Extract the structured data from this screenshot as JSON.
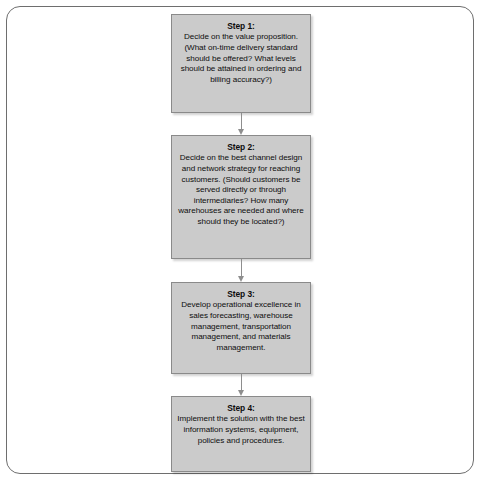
{
  "figure": {
    "type": "flowchart",
    "orientation": "vertical",
    "frame": {
      "border_color": "#6e6e6e",
      "background": "#ffffff",
      "corner_radius": "rounded"
    },
    "box_style": {
      "fill": "#cbcbcb",
      "border_color": "#8a8a8a",
      "text_color": "#0d0d0d",
      "shadow": true
    },
    "connector_style": {
      "kind": "down-arrow",
      "color": "#8e8e8e"
    }
  },
  "steps": [
    {
      "title": "Step 1:",
      "body": "Decide on the value proposition. (What on-time delivery standard should be offered? What levels should be attained in ordering and billing accuracy?)"
    },
    {
      "title": "Step 2:",
      "body": "Decide on the best channel design and network strategy for reaching customers. (Should customers be served directly or through intermediaries? How many warehouses are needed and where should they be located?)"
    },
    {
      "title": "Step 3:",
      "body": "Develop operational excellence in sales forecasting, warehouse management, transportation management, and materials management."
    },
    {
      "title": "Step 4:",
      "body": "Implement the solution with the best information systems, equipment, policies and procedures."
    }
  ],
  "connectors": [
    {
      "from": "Step 1:",
      "to": "Step 2:",
      "label": ""
    },
    {
      "from": "Step 2:",
      "to": "Step 3:",
      "label": ""
    },
    {
      "from": "Step 3:",
      "to": "Step 4:",
      "label": ""
    }
  ]
}
